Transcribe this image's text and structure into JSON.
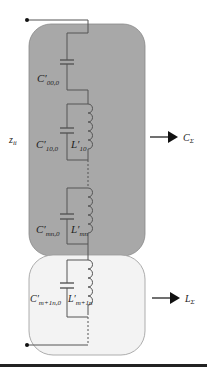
{
  "diagram": {
    "impedance_label": "z",
    "impedance_sub": "ii",
    "capacitive_output": {
      "label": "C",
      "sub": "Σ"
    },
    "inductive_output": {
      "label": "L",
      "sub": "Σ"
    },
    "components": [
      {
        "symbol": "C′",
        "sub": "00,0"
      },
      {
        "symbol": "C′",
        "sub": "10,0"
      },
      {
        "symbol": "L′",
        "sub": "10"
      },
      {
        "symbol": "C′",
        "sub": "mn,0"
      },
      {
        "symbol": "L′",
        "sub": "mn"
      },
      {
        "symbol": "C′",
        "sub": "m+1n,0"
      },
      {
        "symbol": "L′",
        "sub": "m+1n"
      }
    ]
  },
  "colors": {
    "capacitive_region": "#a9a9a9",
    "inductive_region": "#f4f4f4",
    "wire": "#555555"
  }
}
